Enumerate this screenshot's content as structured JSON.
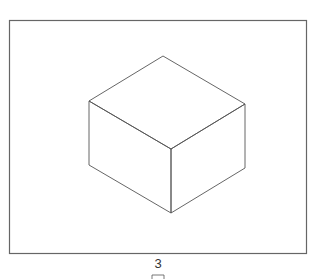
{
  "diagram": {
    "type": "isometric-cube",
    "frame": {
      "x": 9,
      "y": 20,
      "width": 297,
      "height": 233,
      "stroke": "#666666"
    },
    "cube": {
      "stroke": "#555555",
      "vertices": {
        "top": [
          163,
          56
        ],
        "left": [
          89,
          101
        ],
        "right": [
          245,
          104
        ],
        "front_top": [
          171,
          149
        ],
        "bottom_left": [
          89,
          165
        ],
        "bottom_right": [
          245,
          168
        ],
        "bottom": [
          171,
          213
        ]
      }
    }
  },
  "footer": {
    "page_number": "3"
  }
}
